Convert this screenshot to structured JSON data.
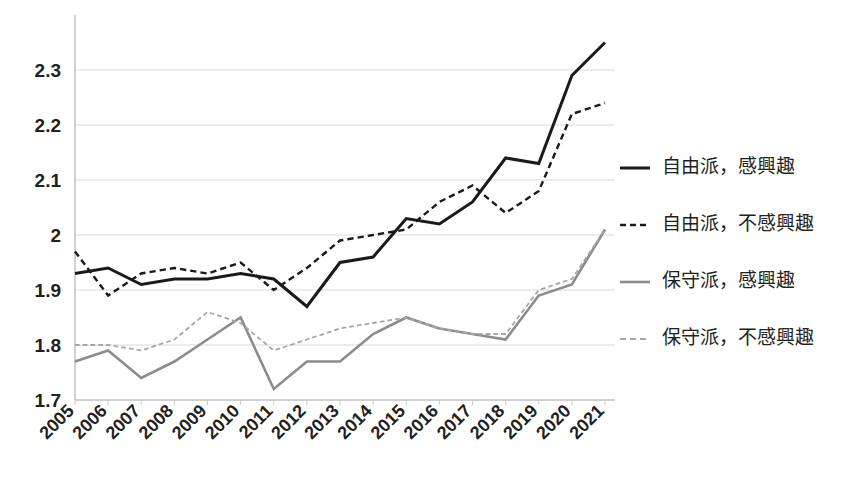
{
  "chart_data": {
    "type": "line",
    "title": "",
    "xlabel": "",
    "ylabel": "",
    "grid": true,
    "legend_position": "right",
    "ylim": [
      1.7,
      2.4
    ],
    "yticks": [
      "1.7",
      "1.8",
      "1.9",
      "2",
      "2.1",
      "2.2",
      "2.3"
    ],
    "ytick_values": [
      1.7,
      1.8,
      1.9,
      2.0,
      2.1,
      2.2,
      2.3
    ],
    "categories": [
      "2005",
      "2006",
      "2007",
      "2008",
      "2009",
      "2010",
      "2011",
      "2012",
      "2013",
      "2014",
      "2015",
      "2016",
      "2017",
      "2018",
      "2019",
      "2020",
      "2021"
    ],
    "x": [
      2005,
      2006,
      2007,
      2008,
      2009,
      2010,
      2011,
      2012,
      2013,
      2014,
      2015,
      2016,
      2017,
      2018,
      2019,
      2020,
      2021
    ],
    "series": [
      {
        "name": "自由派，感興趣",
        "color": "#1a1a1a",
        "style": "solid",
        "width": 3,
        "values": [
          1.93,
          1.94,
          1.91,
          1.92,
          1.92,
          1.93,
          1.92,
          1.87,
          1.95,
          1.96,
          2.03,
          2.02,
          2.06,
          2.14,
          2.13,
          2.29,
          2.35
        ]
      },
      {
        "name": "自由派，不感興趣",
        "color": "#1a1a1a",
        "style": "dashed",
        "width": 2.4,
        "values": [
          1.97,
          1.89,
          1.93,
          1.94,
          1.93,
          1.95,
          1.9,
          1.94,
          1.99,
          2.0,
          2.01,
          2.06,
          2.09,
          2.04,
          2.08,
          2.22,
          2.24
        ]
      },
      {
        "name": "保守派，感興趣",
        "color": "#8c8c8c",
        "style": "solid",
        "width": 2.6,
        "values": [
          1.77,
          1.79,
          1.74,
          1.77,
          1.81,
          1.85,
          1.72,
          1.77,
          1.77,
          1.82,
          1.85,
          1.83,
          1.82,
          1.81,
          1.89,
          1.91,
          2.01
        ]
      },
      {
        "name": "保守派，不感興趣",
        "color": "#a6a6a6",
        "style": "dashed",
        "width": 1.8,
        "values": [
          1.8,
          1.8,
          1.79,
          1.81,
          1.86,
          1.84,
          1.79,
          1.81,
          1.83,
          1.84,
          1.85,
          1.83,
          1.82,
          1.82,
          1.9,
          1.92,
          2.01
        ]
      }
    ]
  },
  "legend": {
    "items": [
      {
        "label": "自由派，感興趣",
        "color": "#1a1a1a",
        "style": "solid"
      },
      {
        "label": "自由派，不感興趣",
        "color": "#1a1a1a",
        "style": "dashed"
      },
      {
        "label": "保守派，感興趣",
        "color": "#8c8c8c",
        "style": "solid"
      },
      {
        "label": "保守派，不感興趣",
        "color": "#a6a6a6",
        "style": "dashed"
      }
    ]
  },
  "colors": {
    "liberal": "#1a1a1a",
    "conservative": "#8c8c8c",
    "grid": "#d9d9d9",
    "axis": "#b3b3b3",
    "text": "#231f20",
    "background": "#ffffff"
  }
}
